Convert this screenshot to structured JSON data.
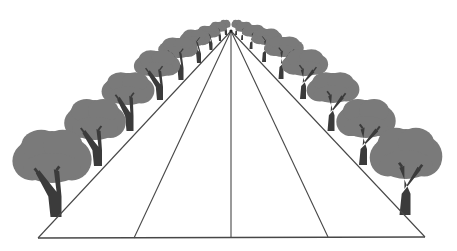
{
  "diagram": {
    "vanishing_point": {
      "x": 231,
      "y": 31
    },
    "colors": {
      "background": "#ffffff",
      "line": "#474747",
      "canopy": "#7a7a7a",
      "trunk": "#3b3b3b",
      "highlight": "#9a9a9a"
    },
    "road_lines": [
      {
        "name": "left-edge",
        "x1": 38,
        "y1": 238,
        "x2": 231,
        "y2": 31
      },
      {
        "name": "left-inner",
        "x1": 134,
        "y1": 238,
        "x2": 231,
        "y2": 31
      },
      {
        "name": "center",
        "x1": 231,
        "y1": 238,
        "x2": 231,
        "y2": 31
      },
      {
        "name": "right-inner",
        "x1": 328,
        "y1": 237,
        "x2": 231,
        "y2": 31
      },
      {
        "name": "right-edge",
        "x1": 425,
        "y1": 237,
        "x2": 231,
        "y2": 31
      }
    ],
    "baseline": {
      "x1": 38,
      "y1": 238,
      "x2": 425,
      "y2": 237
    },
    "trees_left": [
      {
        "cx": 52,
        "cy": 157,
        "rx": 36,
        "ry": 26,
        "base_x": 56,
        "base_y": 217,
        "trunk_w": 11
      },
      {
        "cx": 95,
        "cy": 120,
        "rx": 28,
        "ry": 20,
        "base_x": 98,
        "base_y": 166,
        "trunk_w": 8
      },
      {
        "cx": 128,
        "cy": 89,
        "rx": 24,
        "ry": 16,
        "base_x": 130,
        "base_y": 131,
        "trunk_w": 7
      },
      {
        "cx": 157,
        "cy": 64,
        "rx": 21,
        "ry": 13,
        "base_x": 160,
        "base_y": 100,
        "trunk_w": 6
      },
      {
        "cx": 178,
        "cy": 48,
        "rx": 18,
        "ry": 10,
        "base_x": 181,
        "base_y": 80,
        "trunk_w": 5
      },
      {
        "cx": 195,
        "cy": 38,
        "rx": 14,
        "ry": 8,
        "base_x": 199,
        "base_y": 63,
        "trunk_w": 4
      },
      {
        "cx": 208,
        "cy": 32,
        "rx": 11,
        "ry": 6,
        "base_x": 211,
        "base_y": 50,
        "trunk_w": 3
      },
      {
        "cx": 218,
        "cy": 27,
        "rx": 8,
        "ry": 5,
        "base_x": 220,
        "base_y": 41,
        "trunk_w": 2
      },
      {
        "cx": 225,
        "cy": 24,
        "rx": 5,
        "ry": 4,
        "base_x": 226,
        "base_y": 35,
        "trunk_w": 2
      }
    ],
    "trees_right": [
      {
        "cx": 406,
        "cy": 154,
        "rx": 33,
        "ry": 25,
        "base_x": 405,
        "base_y": 215,
        "trunk_w": 11
      },
      {
        "cx": 366,
        "cy": 119,
        "rx": 27,
        "ry": 19,
        "base_x": 363,
        "base_y": 165,
        "trunk_w": 8
      },
      {
        "cx": 333,
        "cy": 88,
        "rx": 24,
        "ry": 15,
        "base_x": 331,
        "base_y": 131,
        "trunk_w": 7
      },
      {
        "cx": 305,
        "cy": 63,
        "rx": 21,
        "ry": 13,
        "base_x": 303,
        "base_y": 99,
        "trunk_w": 6
      },
      {
        "cx": 284,
        "cy": 47,
        "rx": 18,
        "ry": 10,
        "base_x": 281,
        "base_y": 79,
        "trunk_w": 5
      },
      {
        "cx": 267,
        "cy": 37,
        "rx": 14,
        "ry": 8,
        "base_x": 264,
        "base_y": 62,
        "trunk_w": 4
      },
      {
        "cx": 254,
        "cy": 31,
        "rx": 11,
        "ry": 6,
        "base_x": 251,
        "base_y": 49,
        "trunk_w": 3
      },
      {
        "cx": 244,
        "cy": 27,
        "rx": 8,
        "ry": 5,
        "base_x": 242,
        "base_y": 40,
        "trunk_w": 2
      },
      {
        "cx": 237,
        "cy": 24,
        "rx": 5,
        "ry": 4,
        "base_x": 236,
        "base_y": 35,
        "trunk_w": 2
      }
    ]
  }
}
